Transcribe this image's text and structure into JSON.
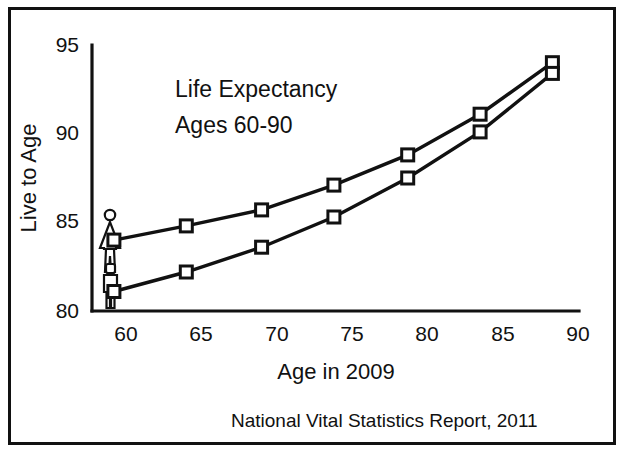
{
  "figure": {
    "title_line1": "Life Expectancy",
    "title_line2": "Ages 60-90",
    "source_note": "National Vital Statistics Report, 2011",
    "axis_color": "#111111",
    "background": "#ffffff"
  },
  "chart_data": {
    "type": "line",
    "title": "Life Expectancy Ages 60-90",
    "xlabel": "Age in 2009",
    "ylabel": "Live to Age",
    "xlim": [
      58,
      90
    ],
    "ylim": [
      80,
      95
    ],
    "xticks": [
      "60",
      "65",
      "70",
      "75",
      "80",
      "85",
      "90"
    ],
    "xtick_values": [
      60,
      65,
      70,
      75,
      80,
      85,
      90
    ],
    "yticks": [
      "80",
      "85",
      "90",
      "95"
    ],
    "ytick_values": [
      80,
      85,
      90,
      95
    ],
    "grid": false,
    "legend": "pictogram-markers-at-left",
    "x": [
      59.2,
      64.0,
      69.0,
      73.8,
      78.7,
      83.5,
      88.3
    ],
    "series": [
      {
        "name": "Female",
        "marker": "open-square",
        "icon": "female-figure-icon",
        "values": [
          84.0,
          84.8,
          85.7,
          87.1,
          88.8,
          91.1,
          94.0
        ]
      },
      {
        "name": "Male",
        "marker": "open-square",
        "icon": "male-figure-icon",
        "values": [
          81.1,
          82.2,
          83.6,
          85.3,
          87.5,
          90.1,
          93.4
        ]
      }
    ]
  }
}
